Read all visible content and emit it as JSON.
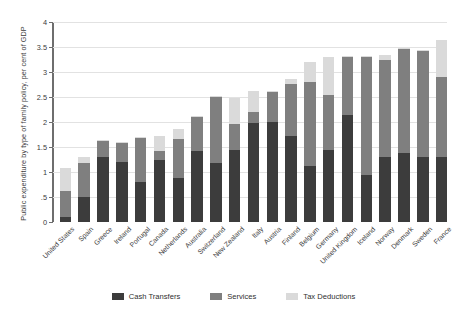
{
  "chart_data": {
    "type": "bar",
    "title": "",
    "subtitle": "",
    "xlabel": "",
    "ylabel": "Public expenditure by type of family policy, per cent of GDP",
    "ylim": [
      0,
      4
    ],
    "yticks": [
      0,
      0.5,
      1,
      1.5,
      2,
      2.5,
      3,
      3.5,
      4
    ],
    "ytick_labels": [
      "0",
      ".5",
      "1",
      "1.5",
      "2",
      "2.5",
      "3",
      "3.5",
      "4"
    ],
    "grid": true,
    "stacked": true,
    "legend_position": "bottom",
    "categories": [
      "United States",
      "Spain",
      "Greece",
      "Ireland",
      "Portugal",
      "Canada",
      "Netherlands",
      "Australia",
      "Switzerland",
      "New Zealand",
      "Italy",
      "Austria",
      "Finland",
      "Belgium",
      "Germany",
      "United Kingdom",
      "Iceland",
      "Norway",
      "Denmark",
      "Sweden",
      "France"
    ],
    "series": [
      {
        "name": "Cash Transfers",
        "color": "#3c3c3c",
        "values": [
          0.1,
          0.5,
          1.3,
          1.2,
          0.8,
          1.25,
          0.88,
          1.42,
          1.18,
          1.45,
          1.98,
          2.0,
          1.72,
          1.12,
          1.45,
          2.15,
          0.95,
          1.3,
          1.38,
          1.3,
          1.3
        ]
      },
      {
        "name": "Services",
        "color": "#7f7f7f",
        "values": [
          0.52,
          0.68,
          0.32,
          0.38,
          0.88,
          0.18,
          0.78,
          0.68,
          1.32,
          0.52,
          0.22,
          0.6,
          1.05,
          1.68,
          1.1,
          1.15,
          2.35,
          1.95,
          2.08,
          2.12,
          1.6
        ]
      },
      {
        "name": "Tax Deductions",
        "color": "#dadada",
        "values": [
          0.46,
          0.12,
          0.02,
          0.02,
          0.02,
          0.3,
          0.2,
          0.02,
          0.02,
          0.52,
          0.42,
          0.02,
          0.1,
          0.4,
          0.75,
          0.02,
          0.02,
          0.1,
          0.02,
          0.02,
          0.75
        ]
      }
    ],
    "totals": [
      1.08,
      1.3,
      1.64,
      1.6,
      1.7,
      1.73,
      1.86,
      2.12,
      2.52,
      2.49,
      2.62,
      2.62,
      2.87,
      3.2,
      3.3,
      3.32,
      3.32,
      3.35,
      3.48,
      3.44,
      3.65
    ]
  },
  "legend": {
    "items": [
      {
        "label": "Cash Transfers"
      },
      {
        "label": "Services"
      },
      {
        "label": "Tax Deductions"
      }
    ]
  }
}
